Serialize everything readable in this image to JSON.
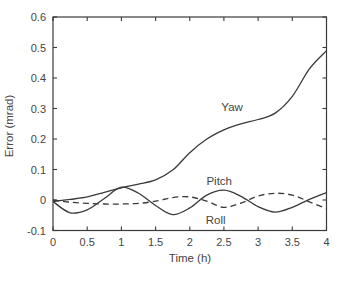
{
  "figure": {
    "background": "#ffffff",
    "line_color": "#3a3a3a",
    "text_color": "#454545"
  },
  "chart_data": {
    "type": "line",
    "title": "",
    "xlabel": "Time (h)",
    "ylabel": "Error (mrad)",
    "xlim": [
      0,
      4
    ],
    "ylim": [
      -0.1,
      0.6
    ],
    "grid": false,
    "legend_position": "inline-labels",
    "x_tick_values": [
      0,
      0.5,
      1,
      1.5,
      2,
      2.5,
      3,
      3.5,
      4
    ],
    "x_tick_labels": [
      "0",
      "0.5",
      "1",
      "1.5",
      "2",
      "2.5",
      "3",
      "3.5",
      "4"
    ],
    "y_tick_values": [
      -0.1,
      0,
      0.1,
      0.2,
      0.3,
      0.4,
      0.5,
      0.6
    ],
    "y_tick_labels": [
      "-0.1",
      "0",
      "0.1",
      "0.2",
      "0.3",
      "0.4",
      "0.5",
      "0.6"
    ],
    "x": [
      0,
      0.25,
      0.5,
      0.75,
      1,
      1.25,
      1.5,
      1.75,
      2,
      2.25,
      2.5,
      2.75,
      3,
      3.25,
      3.5,
      3.75,
      4
    ],
    "series": [
      {
        "name": "Yaw",
        "style": "solid",
        "values": [
          -0.005,
          0.002,
          0.01,
          0.025,
          0.04,
          0.052,
          0.066,
          0.098,
          0.155,
          0.2,
          0.23,
          0.25,
          0.264,
          0.285,
          0.34,
          0.43,
          0.49
        ],
        "label": "Yaw",
        "label_pos": {
          "t": 2.62,
          "v": 0.305
        }
      },
      {
        "name": "Pitch",
        "style": "solid",
        "values": [
          -0.005,
          -0.042,
          -0.032,
          0.005,
          0.042,
          0.022,
          -0.018,
          -0.048,
          -0.026,
          0.016,
          0.032,
          0.012,
          -0.022,
          -0.04,
          -0.024,
          0.002,
          0.024
        ],
        "label": "Pitch",
        "label_pos": {
          "t": 2.43,
          "v": 0.063
        }
      },
      {
        "name": "Roll",
        "style": "dashed",
        "values": [
          0.0,
          -0.007,
          -0.011,
          -0.013,
          -0.013,
          -0.011,
          -0.004,
          0.008,
          0.01,
          -0.004,
          -0.024,
          -0.01,
          0.013,
          0.022,
          0.016,
          -0.006,
          -0.028
        ],
        "label": "Roll",
        "label_pos": {
          "t": 2.38,
          "v": -0.066
        }
      }
    ]
  }
}
